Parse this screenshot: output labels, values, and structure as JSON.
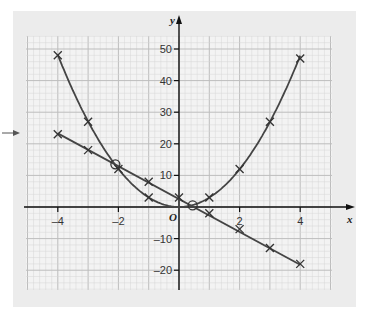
{
  "chart_data": {
    "type": "line",
    "title": "",
    "xlabel": "x",
    "ylabel": "y",
    "origin_label": "O",
    "xlim": [
      -5,
      5.1
    ],
    "ylim": [
      -26,
      56
    ],
    "x_ticks": [
      -4,
      -2,
      2,
      4
    ],
    "x_tick_labels": [
      "–4",
      "–2",
      "2",
      "4"
    ],
    "y_ticks": [
      50,
      40,
      30,
      20,
      10,
      -10,
      -20
    ],
    "y_tick_labels": [
      "50",
      "40",
      "30",
      "20",
      "10",
      "–10",
      "–20"
    ],
    "grid": true,
    "legend": null,
    "series": [
      {
        "name": "curve y = 3x²",
        "marker": "cross",
        "x": [
          -4,
          -3,
          -2,
          -1,
          1,
          2,
          3,
          4
        ],
        "y": [
          48,
          27,
          12,
          3,
          3,
          12,
          27,
          47
        ]
      },
      {
        "name": "line y = -5x + 3",
        "marker": "cross",
        "x": [
          -4,
          -3,
          -1,
          0,
          1,
          2,
          3,
          4
        ],
        "y": [
          23,
          18,
          8,
          3,
          -2,
          -7,
          -13,
          -18
        ]
      }
    ],
    "annotations": [
      {
        "type": "circle",
        "x": -2.1,
        "y": 13.5,
        "label": "intersection"
      },
      {
        "type": "circle",
        "x": 0.45,
        "y": 0.5,
        "label": "intersection"
      },
      {
        "type": "arrow",
        "label": "left-margin pointer arrow"
      }
    ]
  },
  "colors": {
    "panel_bg": "#ececec",
    "grid_major": "#bdbdbd",
    "grid_minor": "#d6d6d6",
    "axis": "#111111",
    "curve": "#444444"
  }
}
